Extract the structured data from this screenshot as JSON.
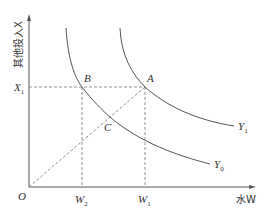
{
  "diagram": {
    "type": "isoquant",
    "axes": {
      "y_label": "其他投入X",
      "x_label": "水W",
      "origin": "O"
    },
    "points": [
      {
        "name": "A",
        "x": 145,
        "y": 87
      },
      {
        "name": "B",
        "x": 82,
        "y": 87
      },
      {
        "name": "C",
        "x": 111,
        "y": 118
      }
    ],
    "ticks": {
      "x1_label": "X",
      "x1_sub": "1",
      "w2_label": "W",
      "w2_sub": "2",
      "w1_label": "W",
      "w1_sub": "1"
    },
    "curves": [
      {
        "name": "Y",
        "sub": "1"
      },
      {
        "name": "Y",
        "sub": "0"
      }
    ],
    "colors": {
      "line": "#555555",
      "dashed": "#777777",
      "text": "#333333"
    }
  }
}
